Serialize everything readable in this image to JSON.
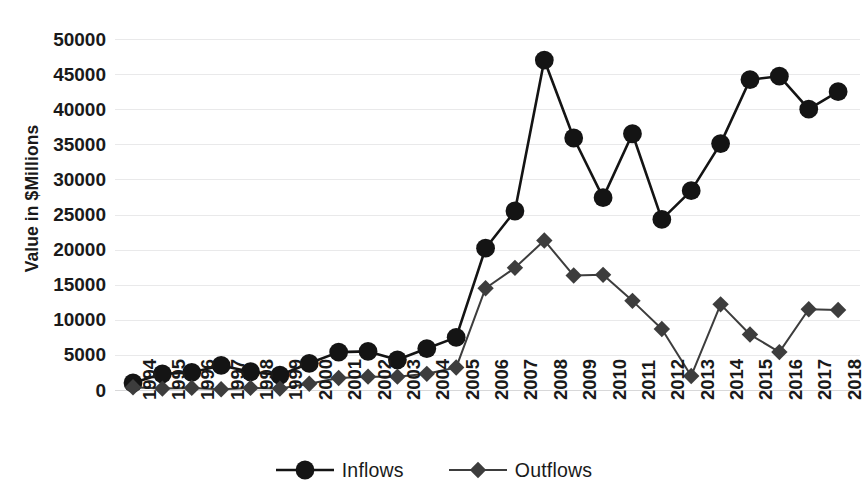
{
  "chart_data": {
    "type": "line",
    "title": "",
    "xlabel": "",
    "ylabel": "Value in $Millions",
    "ylim": [
      0,
      50000
    ],
    "ytick_step": 5000,
    "yticks": [
      "0",
      "5000",
      "10000",
      "15000",
      "20000",
      "25000",
      "30000",
      "35000",
      "40000",
      "45000",
      "50000"
    ],
    "grid": true,
    "legend_position": "bottom-center",
    "categories": [
      "1994",
      "1995",
      "1996",
      "1997",
      "1998",
      "1999",
      "2000",
      "2001",
      "2002",
      "2003",
      "2004",
      "2005",
      "2006",
      "2007",
      "2008",
      "2009",
      "2010",
      "2011",
      "2012",
      "2013",
      "2014",
      "2015",
      "2016",
      "2017",
      "2018"
    ],
    "series": [
      {
        "name": "Inflows",
        "marker": "circle",
        "color": "#141414",
        "values": [
          1000,
          2300,
          2500,
          3500,
          2600,
          2100,
          3800,
          5400,
          5500,
          4300,
          5900,
          7500,
          20200,
          25500,
          47000,
          35900,
          27400,
          36500,
          24300,
          28400,
          35100,
          44200,
          44700,
          40000,
          42500
        ]
      },
      {
        "name": "Outflows",
        "marker": "diamond",
        "color": "#3d3d3d",
        "values": [
          400,
          200,
          300,
          100,
          300,
          200,
          900,
          1700,
          1900,
          1900,
          2300,
          3200,
          14500,
          17400,
          21300,
          16300,
          16400,
          12700,
          8700,
          2000,
          12200,
          7900,
          5400,
          11500,
          11400
        ]
      }
    ]
  },
  "legend": {
    "items": [
      {
        "label": "Inflows",
        "marker": "circle-marker-icon"
      },
      {
        "label": "Outflows",
        "marker": "diamond-marker-icon"
      }
    ]
  },
  "colors": {
    "inflows": "#141414",
    "outflows": "#3d3d3d",
    "gridline": "#e9e9ea",
    "text": "#1a1a1a",
    "background": "#ffffff"
  }
}
